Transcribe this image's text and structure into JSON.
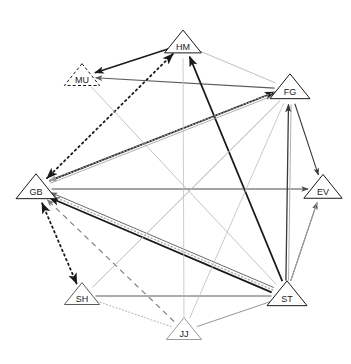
{
  "figure": {
    "top_caption": "",
    "width": 351,
    "height": 364,
    "background": "#ffffff"
  },
  "nodes": [
    {
      "id": "HM",
      "label": "HM",
      "x": 183,
      "y": 44,
      "size": 23,
      "outline": "#1a1a1a",
      "style": "solid"
    },
    {
      "id": "MU",
      "label": "MU",
      "x": 82,
      "y": 77,
      "size": 22,
      "outline": "#1a1a1a",
      "style": "dashed"
    },
    {
      "id": "FG",
      "label": "FG",
      "x": 290,
      "y": 89,
      "size": 25,
      "outline": "#1a1a1a",
      "style": "solid"
    },
    {
      "id": "GB",
      "label": "GB",
      "x": 36,
      "y": 189,
      "size": 25,
      "outline": "#1a1a1a",
      "style": "solid"
    },
    {
      "id": "EV",
      "label": "EV",
      "x": 323,
      "y": 189,
      "size": 24,
      "outline": "#1a1a1a",
      "style": "solid"
    },
    {
      "id": "ST",
      "label": "ST",
      "x": 287,
      "y": 296,
      "size": 25,
      "outline": "#1a1a1a",
      "style": "solid"
    },
    {
      "id": "SH",
      "label": "SH",
      "x": 82,
      "y": 296,
      "size": 22,
      "outline": "#5a5a5a",
      "style": "solid"
    },
    {
      "id": "JJ",
      "label": "JJ",
      "x": 184,
      "y": 331,
      "size": 22,
      "outline": "#9a9a9a",
      "style": "solid"
    }
  ],
  "edges": [
    {
      "from": "HM",
      "to": "MU",
      "style": "solid",
      "color": "#1a1a1a",
      "width": 1.5,
      "arrow": "end"
    },
    {
      "from": "FG",
      "to": "MU",
      "style": "solid",
      "color": "#5a5a5a",
      "width": 1.1,
      "arrow": "end"
    },
    {
      "from": "HM",
      "to": "GB",
      "style": "dotted",
      "color": "#1a1a1a",
      "width": 1.8,
      "arrow": "both"
    },
    {
      "from": "HM",
      "to": "FG",
      "style": "solid",
      "color": "#b0b0b0",
      "width": 0.8,
      "arrow": "none"
    },
    {
      "from": "HM",
      "to": "ST",
      "style": "solid",
      "color": "#b5b5b5",
      "width": 0.8,
      "arrow": "none"
    },
    {
      "from": "ST",
      "to": "HM",
      "style": "solid",
      "color": "#1a1a1a",
      "width": 1.7,
      "arrow": "end"
    },
    {
      "from": "GB",
      "to": "FG",
      "style": "solid",
      "color": "#1a1a1a",
      "width": 1.7,
      "arrow": "end"
    },
    {
      "from": "GB",
      "to": "FG",
      "style": "solid",
      "color": "#9a9a9a",
      "width": 0.8,
      "arrow": "none"
    },
    {
      "from": "GB",
      "to": "EV",
      "style": "solid",
      "color": "#4a4a4a",
      "width": 1.1,
      "arrow": "end"
    },
    {
      "from": "FG",
      "to": "EV",
      "style": "solid",
      "color": "#3a3a3a",
      "width": 1.1,
      "arrow": "end"
    },
    {
      "from": "ST",
      "to": "EV",
      "style": "solid",
      "color": "#4a4a4a",
      "width": 1.1,
      "arrow": "end"
    },
    {
      "from": "ST",
      "to": "FG",
      "style": "solid",
      "color": "#3a3a3a",
      "width": 1.3,
      "arrow": "end"
    },
    {
      "from": "ST",
      "to": "FG",
      "style": "solid",
      "color": "#b0b0b0",
      "width": 1.0,
      "arrow": "none"
    },
    {
      "from": "ST",
      "to": "GB",
      "style": "solid",
      "color": "#1a1a1a",
      "width": 1.8,
      "arrow": "end"
    },
    {
      "from": "ST",
      "to": "GB",
      "style": "dotted",
      "color": "#a8a8a8",
      "width": 1.3,
      "arrow": "none"
    },
    {
      "from": "ST",
      "to": "GB",
      "style": "solid",
      "color": "#6a6a6a",
      "width": 1.0,
      "arrow": "end"
    },
    {
      "from": "ST",
      "to": "SH",
      "style": "solid",
      "color": "#5a5a5a",
      "width": 1.0,
      "arrow": "none"
    },
    {
      "from": "ST",
      "to": "JJ",
      "style": "solid",
      "color": "#8a8a8a",
      "width": 0.9,
      "arrow": "none"
    },
    {
      "from": "ST",
      "to": "MU",
      "style": "solid",
      "color": "#b5b5b5",
      "width": 0.8,
      "arrow": "none"
    },
    {
      "from": "FG",
      "to": "GB",
      "style": "dotted",
      "color": "#9a9a9a",
      "width": 1.2,
      "arrow": "end"
    },
    {
      "from": "FG",
      "to": "SH",
      "style": "solid",
      "color": "#bcbcbc",
      "width": 0.8,
      "arrow": "none"
    },
    {
      "from": "FG",
      "to": "JJ",
      "style": "solid",
      "color": "#bcbcbc",
      "width": 0.8,
      "arrow": "none"
    },
    {
      "from": "JJ",
      "to": "GB",
      "style": "dashed",
      "color": "#7a7a7a",
      "width": 1.1,
      "arrow": "end"
    },
    {
      "from": "JJ",
      "to": "SH",
      "style": "dotted",
      "color": "#c2c2c2",
      "width": 1.2,
      "arrow": "none"
    },
    {
      "from": "JJ",
      "to": "HM",
      "style": "solid",
      "color": "#c0c0c0",
      "width": 0.8,
      "arrow": "none"
    },
    {
      "from": "SH",
      "to": "GB",
      "style": "dotted",
      "color": "#1a1a1a",
      "width": 1.8,
      "arrow": "both"
    },
    {
      "from": "SH",
      "to": "FG",
      "style": "solid",
      "color": "#bcbcbc",
      "width": 0.8,
      "arrow": "none"
    },
    {
      "from": "EV",
      "to": "ST",
      "style": "solid",
      "color": "#b8b8b8",
      "width": 0.8,
      "arrow": "none"
    }
  ],
  "legend": {
    "node_shape": "triangle",
    "edge_styles": [
      "solid",
      "dotted",
      "dashed"
    ],
    "arrow_types": [
      "end",
      "both",
      "none"
    ]
  }
}
